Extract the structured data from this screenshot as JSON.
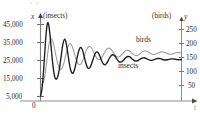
{
  "chart_data": {
    "type": "line",
    "title": "",
    "subtitle": "",
    "xlabel": "t",
    "ylabel": "x (insects)",
    "y2label": "y (birds)",
    "left_axis_caption": "(insects)",
    "left_axis_var": "x",
    "right_axis_caption": "(birds)",
    "right_axis_var": "y",
    "origin_label": "0",
    "grid": false,
    "legend_position": "inline-annotations",
    "left_ticks": [
      "5,000",
      "15,000",
      "25,000",
      "35,000",
      "45,000"
    ],
    "left_tick_values": [
      5000,
      15000,
      25000,
      35000,
      45000
    ],
    "right_ticks": [
      "50",
      "100",
      "150",
      "200",
      "250"
    ],
    "right_tick_values": [
      50,
      100,
      150,
      200,
      250
    ],
    "ylim": [
      0,
      50000
    ],
    "y2lim": [
      0,
      277
    ],
    "xlim": [
      0,
      100
    ],
    "annotations": [
      {
        "text": "birds",
        "x": 72,
        "y": 205
      },
      {
        "text": "insects",
        "x": 62,
        "y": 21500
      }
    ],
    "series": [
      {
        "name": "insects",
        "axis": "left",
        "color": "#1c1c1c",
        "units": "insects",
        "equilibrium": 25500,
        "values": [
          5200,
          9000,
          17500,
          29000,
          40000,
          45800,
          44000,
          37000,
          28500,
          21000,
          16200,
          14600,
          15600,
          18600,
          23600,
          29500,
          34500,
          36800,
          35400,
          31000,
          25600,
          21000,
          18400,
          18000,
          19600,
          22800,
          26600,
          30000,
          32000,
          32000,
          30200,
          27200,
          24000,
          21600,
          20600,
          21000,
          22600,
          25000,
          27400,
          29200,
          29800,
          29200,
          27600,
          25600,
          23800,
          22800,
          22700,
          23500,
          24900,
          26400,
          27600,
          28200,
          28000,
          27200,
          26000,
          24900,
          24200,
          24100,
          24500,
          25300,
          26200,
          26900,
          27200,
          27100,
          26600,
          25900,
          25200,
          24800,
          24700,
          24900,
          25400,
          25900,
          26300,
          26500,
          26400,
          26100,
          25700,
          25300,
          25100,
          25100,
          25300,
          25600,
          25900,
          26100,
          26100,
          26000,
          25700,
          25500,
          25300,
          25300,
          25400,
          25600,
          25800,
          25900,
          25900,
          25800,
          25600,
          25500,
          25400,
          25400,
          25500
        ]
      },
      {
        "name": "birds",
        "axis": "right",
        "color": "#9a9a9a",
        "units": "birds",
        "equilibrium": 163,
        "values": [
          52,
          54,
          62,
          82,
          118,
          160,
          196,
          215,
          216,
          203,
          180,
          155,
          133,
          117,
          109,
          110,
          120,
          138,
          160,
          181,
          195,
          200,
          195,
          182,
          165,
          148,
          134,
          126,
          124,
          129,
          140,
          154,
          169,
          181,
          188,
          189,
          185,
          176,
          165,
          155,
          147,
          143,
          143,
          147,
          155,
          164,
          173,
          180,
          183,
          183,
          179,
          173,
          166,
          159,
          154,
          152,
          153,
          157,
          162,
          168,
          173,
          176,
          176,
          174,
          170,
          165,
          161,
          158,
          157,
          158,
          161,
          165,
          169,
          172,
          173,
          173,
          171,
          168,
          165,
          162,
          161,
          161,
          163,
          165,
          168,
          170,
          170,
          170,
          168,
          166,
          164,
          162,
          162,
          162,
          163,
          165,
          167,
          168,
          168,
          167,
          166
        ]
      }
    ]
  },
  "axes": {
    "left_head": "(insects)",
    "left_var": "x",
    "right_head": "(birds)",
    "right_var": "y",
    "x_var": "t",
    "origin": "0"
  },
  "tick_labels": {
    "left": {
      "t5": "5,000",
      "t15": "15,000",
      "t25": "25,000",
      "t35": "35,000",
      "t45": "45,000"
    },
    "right": {
      "r50": "50",
      "r100": "100",
      "r150": "150",
      "r200": "200",
      "r250": "250"
    }
  },
  "series_labels": {
    "birds": "birds",
    "insects": "insects"
  }
}
